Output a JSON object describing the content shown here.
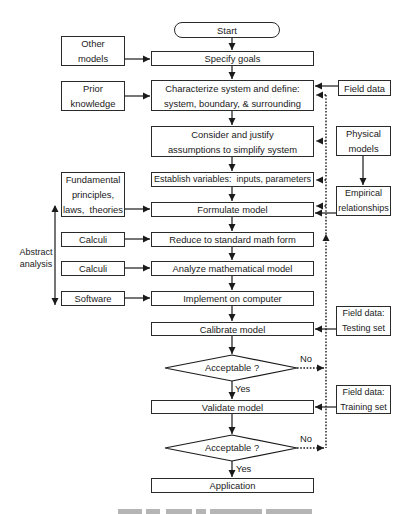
{
  "flowchart": {
    "start": "Start",
    "main_steps": [
      {
        "id": "specify-goals",
        "label": "Specify goals"
      },
      {
        "id": "characterize",
        "lines": [
          "Characterize system and define:",
          "system, boundary, & surrounding"
        ]
      },
      {
        "id": "consider",
        "lines": [
          "Consider and justify",
          "assumptions to simplify system"
        ]
      },
      {
        "id": "establish-variables",
        "label": "Establish variables:  inputs, parameters"
      },
      {
        "id": "formulate",
        "label": "Formulate model"
      },
      {
        "id": "reduce",
        "label": "Reduce to standard math form"
      },
      {
        "id": "analyze",
        "label": "Analyze mathematical model"
      },
      {
        "id": "implement",
        "label": "Implement on computer"
      },
      {
        "id": "calibrate",
        "label": "Calibrate model"
      },
      {
        "id": "validate",
        "label": "Validate model"
      },
      {
        "id": "application",
        "label": "Application"
      }
    ],
    "decisions": [
      {
        "label": "Acceptable ?",
        "yes": "Yes",
        "no": "No"
      },
      {
        "label": "Acceptable ?",
        "yes": "Yes",
        "no": "No"
      }
    ],
    "left_inputs": [
      {
        "id": "other-models",
        "lines": [
          "Other",
          "models"
        ]
      },
      {
        "id": "prior-knowledge",
        "lines": [
          "Prior",
          "knowledge"
        ]
      },
      {
        "id": "fundamental",
        "lines": [
          "Fundamental",
          "principles,",
          "laws,  theories"
        ]
      },
      {
        "id": "calculi-1",
        "label": "Calculi"
      },
      {
        "id": "calculi-2",
        "label": "Calculi"
      },
      {
        "id": "software",
        "label": "Software"
      }
    ],
    "right_inputs": [
      {
        "id": "field-data",
        "label": "Field data"
      },
      {
        "id": "physical-models",
        "lines": [
          "Physical",
          "models"
        ]
      },
      {
        "id": "empirical",
        "lines": [
          "Empirical",
          "relationships"
        ]
      },
      {
        "id": "field-data-testing",
        "lines": [
          "Field data:",
          "Testing set"
        ]
      },
      {
        "id": "field-data-training",
        "lines": [
          "Field data:",
          "Training set"
        ]
      }
    ],
    "abstract_analysis": [
      "Abstract",
      "analysis"
    ],
    "colors": {
      "line": "#2a2a2a",
      "background": "#ffffff"
    }
  }
}
